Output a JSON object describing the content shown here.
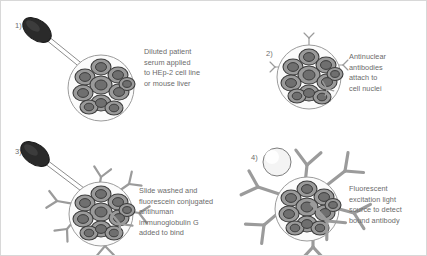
{
  "figure": {
    "background_color": "#ffffff",
    "border_color": "#d8d8d8",
    "text_color": "#6b6b6b",
    "cell_fill": "#9a9a9a",
    "cell_outline": "#3d3d3d",
    "nucleus_fill": "#707070",
    "antibody_color": "#9b9b9b",
    "dropper_bulb_color": "#2a2a2a",
    "light_source_color": "#f4f4f4"
  },
  "panels": [
    {
      "number": "1)",
      "caption": "Diluted patient\nserum applied\nto HEp-2 cell line\nor mouse liver",
      "has_dropper": true,
      "has_light_source": false,
      "antibody_count": 0,
      "antibody_size": "none"
    },
    {
      "number": "2)",
      "caption": "Antinuclear\nantibodies\nattach to\ncell nuclei",
      "has_dropper": false,
      "has_light_source": false,
      "antibody_count": 4,
      "antibody_size": "small"
    },
    {
      "number": "3)",
      "caption": "Slide washed and\nfluorescein conjugated\nantihuman\nimmunoglobulin G\nadded to bind",
      "has_dropper": true,
      "has_light_source": false,
      "antibody_count": 7,
      "antibody_size": "medium"
    },
    {
      "number": "4)",
      "caption": "Fluorescent\nexcitation light\nsource to detect\nbound antibody",
      "has_dropper": false,
      "has_light_source": true,
      "antibody_count": 7,
      "antibody_size": "large"
    }
  ]
}
